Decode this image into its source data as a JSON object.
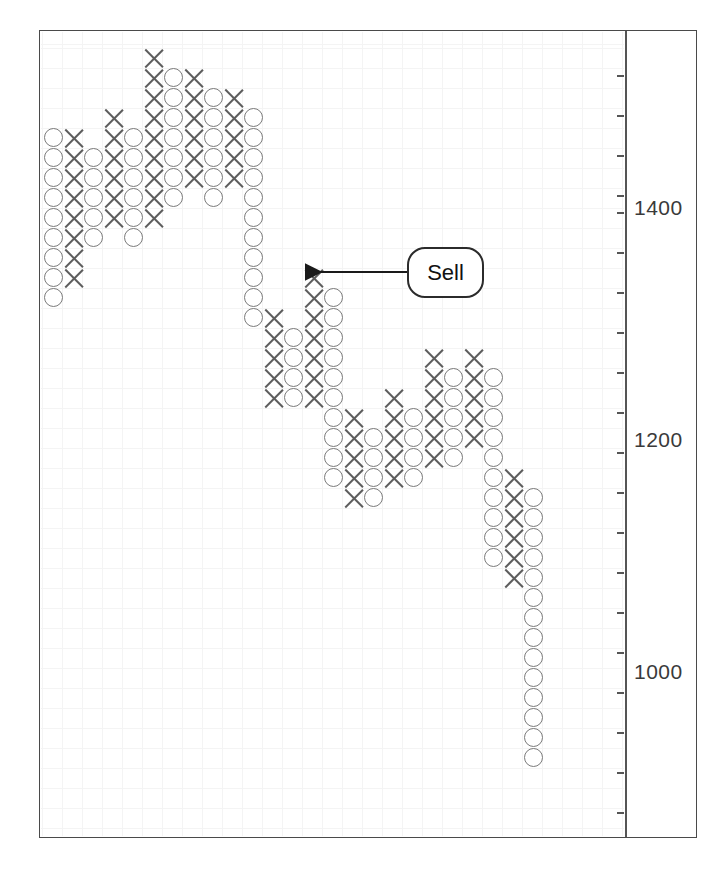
{
  "chart_data": {
    "type": "scatter",
    "chart_kind": "point-and-figure",
    "title": "",
    "xlabel": "",
    "ylabel": "",
    "ylim": [
      880,
      1560
    ],
    "grid": true,
    "legend_position": "none",
    "y_axis": {
      "position": "right",
      "tick_labels": [
        "1400",
        "1200",
        "1000"
      ],
      "tick_values": [
        1400,
        1200,
        1000
      ],
      "minor_tick_step": 33,
      "minor_tick_count": 18
    },
    "annotations": [
      {
        "label": "Sell",
        "shape": "rounded-rect-callout",
        "arrow": "left",
        "points_to_column": 14,
        "points_to_value": 1330
      }
    ],
    "box_size": 20,
    "columns": [
      {
        "index": 0,
        "mark": "O",
        "top": 1398,
        "bottom": 1317,
        "count": 7
      },
      {
        "index": 1,
        "mark": "X",
        "top": 1404,
        "bottom": 1328,
        "count": 7
      },
      {
        "index": 2,
        "mark": "O",
        "top": 1392,
        "bottom": 1344,
        "count": 5
      },
      {
        "index": 3,
        "mark": "X",
        "top": 1409,
        "bottom": 1355,
        "count": 5
      },
      {
        "index": 4,
        "mark": "O",
        "top": 1398,
        "bottom": 1344,
        "count": 5
      },
      {
        "index": 5,
        "mark": "X",
        "top": 1447,
        "bottom": 1355,
        "count": 7
      },
      {
        "index": 6,
        "mark": "O",
        "top": 1436,
        "bottom": 1371,
        "count": 6
      },
      {
        "index": 7,
        "mark": "X",
        "top": 1441,
        "bottom": 1382,
        "count": 5
      },
      {
        "index": 8,
        "mark": "O",
        "top": 1425,
        "bottom": 1366,
        "count": 5
      },
      {
        "index": 9,
        "mark": "X",
        "top": 1430,
        "bottom": 1377,
        "count": 5
      },
      {
        "index": 10,
        "mark": "O",
        "top": 1414,
        "bottom": 1290,
        "count": 11
      },
      {
        "index": 11,
        "mark": "X",
        "top": 1296,
        "bottom": 1236,
        "count": 5
      },
      {
        "index": 12,
        "mark": "O",
        "top": 1285,
        "bottom": 1241,
        "count": 4
      },
      {
        "index": 13,
        "mark": "X",
        "top": 1318,
        "bottom": 1247,
        "count": 6
      },
      {
        "index": 14,
        "mark": "O",
        "top": 1301,
        "bottom": 1121,
        "count": 15
      },
      {
        "index": 15,
        "mark": "X",
        "top": 1192,
        "bottom": 1132,
        "count": 5
      },
      {
        "index": 16,
        "mark": "O",
        "top": 1181,
        "bottom": 1143,
        "count": 4
      },
      {
        "index": 17,
        "mark": "X",
        "top": 1214,
        "bottom": 1154,
        "count": 5
      },
      {
        "index": 18,
        "mark": "O",
        "top": 1203,
        "bottom": 1165,
        "count": 4
      },
      {
        "index": 19,
        "mark": "X",
        "top": 1257,
        "bottom": 1170,
        "count": 7
      },
      {
        "index": 20,
        "mark": "O",
        "top": 1246,
        "bottom": 1192,
        "count": 5
      },
      {
        "index": 21,
        "mark": "X",
        "top": 1262,
        "bottom": 1203,
        "count": 5
      },
      {
        "index": 22,
        "mark": "O",
        "top": 1251,
        "bottom": 1062,
        "count": 14
      },
      {
        "index": 23,
        "mark": "X",
        "top": 1116,
        "bottom": 1046,
        "count": 6
      },
      {
        "index": 24,
        "mark": "O",
        "top": 1105,
        "bottom": 900,
        "count": 16
      }
    ]
  },
  "marks": {
    "columns": [
      {
        "col": 0,
        "type": "O",
        "r0": 7,
        "r1": 15
      },
      {
        "col": 1,
        "type": "X",
        "r0": 7,
        "r1": 14
      },
      {
        "col": 2,
        "type": "O",
        "r0": 8,
        "r1": 12
      },
      {
        "col": 3,
        "type": "X",
        "r0": 6,
        "r1": 11
      },
      {
        "col": 4,
        "type": "O",
        "r0": 7,
        "r1": 12
      },
      {
        "col": 5,
        "type": "X",
        "r0": 3,
        "r1": 11
      },
      {
        "col": 6,
        "type": "O",
        "r0": 4,
        "r1": 10
      },
      {
        "col": 7,
        "type": "X",
        "r0": 4,
        "r1": 9
      },
      {
        "col": 8,
        "type": "O",
        "r0": 5,
        "r1": 10
      },
      {
        "col": 9,
        "type": "X",
        "r0": 5,
        "r1": 9
      },
      {
        "col": 10,
        "type": "O",
        "r0": 6,
        "r1": 16
      },
      {
        "col": 11,
        "type": "X",
        "r0": 16,
        "r1": 20
      },
      {
        "col": 12,
        "type": "O",
        "r0": 17,
        "r1": 20
      },
      {
        "col": 13,
        "type": "X",
        "r0": 14,
        "r1": 20
      },
      {
        "col": 14,
        "type": "O",
        "r0": 15,
        "r1": 24
      },
      {
        "col": 15,
        "type": "X",
        "r0": 21,
        "r1": 25
      },
      {
        "col": 16,
        "type": "O",
        "r0": 22,
        "r1": 25
      },
      {
        "col": 17,
        "type": "X",
        "r0": 20,
        "r1": 24
      },
      {
        "col": 18,
        "type": "O",
        "r0": 21,
        "r1": 24
      },
      {
        "col": 19,
        "type": "X",
        "r0": 18,
        "r1": 23
      },
      {
        "col": 20,
        "type": "O",
        "r0": 19,
        "r1": 23
      },
      {
        "col": 21,
        "type": "X",
        "r0": 18,
        "r1": 22
      },
      {
        "col": 22,
        "type": "O",
        "r0": 19,
        "r1": 28
      },
      {
        "col": 23,
        "type": "X",
        "r0": 24,
        "r1": 29
      },
      {
        "col": 24,
        "type": "O",
        "r0": 25,
        "r1": 38
      }
    ]
  },
  "geometry": {
    "box": 20,
    "x0": 3,
    "y0": 96,
    "axis_ticks_y": [
      75,
      115,
      155,
      195,
      212,
      252,
      292,
      332,
      372,
      412,
      452,
      492,
      532,
      572,
      612,
      652,
      692,
      732,
      772,
      812
    ],
    "labels": [
      {
        "text": "1400",
        "y": 196
      },
      {
        "text": "1200",
        "y": 428
      },
      {
        "text": "1000",
        "y": 660
      }
    ]
  },
  "annotation": {
    "sell_label": "Sell",
    "arrow": {
      "tip_x": 296,
      "tip_y": 272,
      "tail_x": 408,
      "tail_y": 272
    }
  },
  "colors": {
    "frame": "#4a4a4a",
    "grid": "#f4f4f4",
    "o_mark": "#7a7a7a",
    "x_mark": "#5d5d5d",
    "axis": "#555555",
    "text": "#3a3a3a",
    "callout_border": "#2b2b2b",
    "background": "#ffffff"
  }
}
